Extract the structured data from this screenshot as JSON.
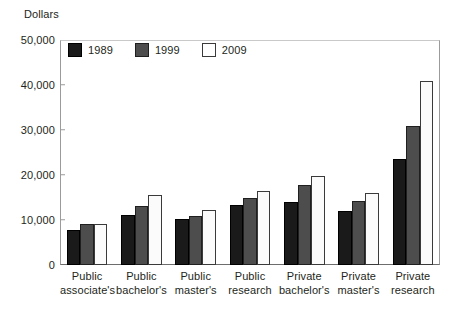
{
  "chart_data": {
    "type": "bar",
    "title": "",
    "subtitle": "",
    "xlabel": "",
    "ylabel": "Dollars",
    "ylim": [
      0,
      50000
    ],
    "yticks": [
      0,
      10000,
      20000,
      30000,
      40000,
      50000
    ],
    "ytick_labels": [
      "0",
      "10,000",
      "20,000",
      "30,000",
      "40,000",
      "50,000"
    ],
    "grid": false,
    "legend_position": "top-left inside plot",
    "categories": [
      "Public associate's",
      "Public bachelor's",
      "Public master's",
      "Public research",
      "Private bachelor's",
      "Private master's",
      "Private research"
    ],
    "category_lines": [
      [
        "Public",
        "associate's"
      ],
      [
        "Public",
        "bachelor's"
      ],
      [
        "Public",
        "master's"
      ],
      [
        "Public",
        "research"
      ],
      [
        "Private",
        "bachelor's"
      ],
      [
        "Private",
        "master's"
      ],
      [
        "Private",
        "research"
      ]
    ],
    "series": [
      {
        "name": "1989",
        "color": "#1a1a1a",
        "values": [
          7800,
          11200,
          10200,
          13300,
          14000,
          12000,
          23500
        ]
      },
      {
        "name": "1999",
        "color": "#4d4d4d",
        "values": [
          9200,
          13200,
          11000,
          15000,
          17800,
          14200,
          31000
        ]
      },
      {
        "name": "2009",
        "color": "#ffffff",
        "values": [
          9200,
          15500,
          12200,
          16500,
          19800,
          16000,
          40800
        ]
      }
    ]
  }
}
